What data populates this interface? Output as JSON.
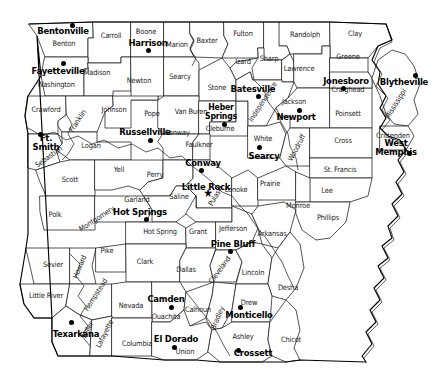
{
  "map": {
    "title": "Arkansas County Map",
    "state": "Arkansas",
    "style": {
      "background": "#ffffff",
      "county_fill": "#ffffff",
      "county_stroke": "#1a1a1a",
      "state_stroke": "#000000",
      "label_color": "#1b1b1b",
      "city_color": "#000000"
    },
    "counties": [
      {
        "name": "Benton",
        "x": 64,
        "y": 44,
        "rot": 0
      },
      {
        "name": "Carroll",
        "x": 111,
        "y": 36,
        "rot": 0
      },
      {
        "name": "Boone",
        "x": 146,
        "y": 32,
        "rot": 0
      },
      {
        "name": "Marion",
        "x": 177,
        "y": 45,
        "rot": 0
      },
      {
        "name": "Baxter",
        "x": 207,
        "y": 41,
        "rot": 0
      },
      {
        "name": "Fulton",
        "x": 243,
        "y": 34,
        "rot": 0
      },
      {
        "name": "Randolph",
        "x": 305,
        "y": 35,
        "rot": 0
      },
      {
        "name": "Clay",
        "x": 355,
        "y": 34,
        "rot": 0
      },
      {
        "name": "Washington",
        "x": 56,
        "y": 85,
        "rot": 0
      },
      {
        "name": "Madison",
        "x": 97,
        "y": 73,
        "rot": 0
      },
      {
        "name": "Newton",
        "x": 139,
        "y": 81,
        "rot": 0
      },
      {
        "name": "Searcy",
        "x": 180,
        "y": 77,
        "rot": 0
      },
      {
        "name": "Stone",
        "x": 217,
        "y": 88,
        "rot": 0
      },
      {
        "name": "Izard",
        "x": 243,
        "y": 62,
        "rot": 0
      },
      {
        "name": "Sharp",
        "x": 269,
        "y": 59,
        "rot": 0
      },
      {
        "name": "Lawrence",
        "x": 299,
        "y": 69,
        "rot": 0
      },
      {
        "name": "Greene",
        "x": 348,
        "y": 57,
        "rot": 0
      },
      {
        "name": "Craighead",
        "x": 348,
        "y": 90,
        "rot": 0
      },
      {
        "name": "Crawford",
        "x": 46,
        "y": 110,
        "rot": 0
      },
      {
        "name": "Franklin",
        "x": 78,
        "y": 121,
        "rot": -56
      },
      {
        "name": "Johnson",
        "x": 114,
        "y": 110,
        "rot": 0
      },
      {
        "name": "Pope",
        "x": 152,
        "y": 114,
        "rot": 0
      },
      {
        "name": "Van Buren",
        "x": 191,
        "y": 112,
        "rot": 0
      },
      {
        "name": "Cleburne",
        "x": 220,
        "y": 129,
        "rot": 0
      },
      {
        "name": "Independence",
        "x": 263,
        "y": 102,
        "rot": -57
      },
      {
        "name": "Jackson",
        "x": 294,
        "y": 102,
        "rot": 0
      },
      {
        "name": "Poinsett",
        "x": 348,
        "y": 114,
        "rot": 0
      },
      {
        "name": "Mississippi",
        "x": 396,
        "y": 104,
        "rot": -58
      },
      {
        "name": "Sebastian",
        "x": 49,
        "y": 157,
        "rot": -36
      },
      {
        "name": "Logan",
        "x": 91,
        "y": 146,
        "rot": 0
      },
      {
        "name": "Conway",
        "x": 177,
        "y": 133,
        "rot": 0
      },
      {
        "name": "Faulkner",
        "x": 199,
        "y": 145,
        "rot": 0
      },
      {
        "name": "White",
        "x": 263,
        "y": 139,
        "rot": 0
      },
      {
        "name": "Woodruff",
        "x": 297,
        "y": 148,
        "rot": -62
      },
      {
        "name": "Cross",
        "x": 343,
        "y": 141,
        "rot": 0
      },
      {
        "name": "Crittenden",
        "x": 393,
        "y": 136,
        "rot": 0
      },
      {
        "name": "Scott",
        "x": 70,
        "y": 180,
        "rot": 0
      },
      {
        "name": "Yell",
        "x": 119,
        "y": 170,
        "rot": 0
      },
      {
        "name": "Perry",
        "x": 155,
        "y": 175,
        "rot": 0
      },
      {
        "name": "Pulaski",
        "x": 216,
        "y": 196,
        "rot": -60
      },
      {
        "name": "Lonoke",
        "x": 236,
        "y": 190,
        "rot": 0
      },
      {
        "name": "Prairie",
        "x": 270,
        "y": 184,
        "rot": 0
      },
      {
        "name": "St. Francis",
        "x": 340,
        "y": 170,
        "rot": 0
      },
      {
        "name": "Lee",
        "x": 327,
        "y": 191,
        "rot": 0
      },
      {
        "name": "Montgomery",
        "x": 97,
        "y": 219,
        "rot": -33
      },
      {
        "name": "Garland",
        "x": 137,
        "y": 200,
        "rot": 0
      },
      {
        "name": "Saline",
        "x": 179,
        "y": 197,
        "rot": 0
      },
      {
        "name": "Monroe",
        "x": 298,
        "y": 206,
        "rot": 0
      },
      {
        "name": "Polk",
        "x": 55,
        "y": 215,
        "rot": 0
      },
      {
        "name": "Hot Spring",
        "x": 160,
        "y": 232,
        "rot": 0
      },
      {
        "name": "Grant",
        "x": 198,
        "y": 232,
        "rot": 0
      },
      {
        "name": "Jefferson",
        "x": 233,
        "y": 229,
        "rot": 0
      },
      {
        "name": "Arkansas",
        "x": 272,
        "y": 234,
        "rot": 0
      },
      {
        "name": "Phillips",
        "x": 328,
        "y": 218,
        "rot": 0
      },
      {
        "name": "Sevier",
        "x": 53,
        "y": 265,
        "rot": 0
      },
      {
        "name": "Howard",
        "x": 80,
        "y": 267,
        "rot": -68
      },
      {
        "name": "Pike",
        "x": 107,
        "y": 251,
        "rot": 0
      },
      {
        "name": "Clark",
        "x": 145,
        "y": 262,
        "rot": 0
      },
      {
        "name": "Dallas",
        "x": 186,
        "y": 270,
        "rot": 0
      },
      {
        "name": "Cleveland",
        "x": 220,
        "y": 270,
        "rot": -54
      },
      {
        "name": "Lincoln",
        "x": 253,
        "y": 273,
        "rot": 0
      },
      {
        "name": "Desha",
        "x": 288,
        "y": 288,
        "rot": 0
      },
      {
        "name": "Little River",
        "x": 46,
        "y": 296,
        "rot": 0
      },
      {
        "name": "Hempstead",
        "x": 96,
        "y": 295,
        "rot": -57
      },
      {
        "name": "Nevada",
        "x": 131,
        "y": 306,
        "rot": 0
      },
      {
        "name": "Ouachita",
        "x": 166,
        "y": 317,
        "rot": 0
      },
      {
        "name": "Calhoun",
        "x": 198,
        "y": 310,
        "rot": 0
      },
      {
        "name": "Bradley",
        "x": 218,
        "y": 318,
        "rot": -67
      },
      {
        "name": "Drew",
        "x": 249,
        "y": 303,
        "rot": 0
      },
      {
        "name": "Miller",
        "x": 88,
        "y": 330,
        "rot": -63
      },
      {
        "name": "Lafayette",
        "x": 105,
        "y": 334,
        "rot": -63
      },
      {
        "name": "Columbia",
        "x": 137,
        "y": 344,
        "rot": 0
      },
      {
        "name": "Union",
        "x": 185,
        "y": 352,
        "rot": 0
      },
      {
        "name": "Ashley",
        "x": 243,
        "y": 337,
        "rot": 0
      },
      {
        "name": "Chicot",
        "x": 291,
        "y": 340,
        "rot": 0
      }
    ],
    "cities": [
      {
        "name": "Bentonville",
        "label_x": 63,
        "label_y": 30,
        "dot_x": 72,
        "dot_y": 25,
        "marker": "dot",
        "size": "big",
        "lines": [
          "Bentonville"
        ]
      },
      {
        "name": "Harrison",
        "label_x": 148,
        "label_y": 42,
        "dot_x": 148,
        "dot_y": 50,
        "marker": "dot",
        "size": "big",
        "lines": [
          "Harrison"
        ]
      },
      {
        "name": "Fayetteville",
        "label_x": 58,
        "label_y": 70,
        "dot_x": 63,
        "dot_y": 63,
        "marker": "dot",
        "size": "big",
        "lines": [
          "Fayetteville"
        ]
      },
      {
        "name": "Batesville",
        "label_x": 253,
        "label_y": 88,
        "dot_x": 258,
        "dot_y": 96,
        "marker": "dot",
        "size": "big",
        "lines": [
          "Batesville"
        ]
      },
      {
        "name": "Jonesboro",
        "label_x": 346,
        "label_y": 80,
        "dot_x": 343,
        "dot_y": 88,
        "marker": "dot",
        "size": "big",
        "lines": [
          "Jonesboro"
        ]
      },
      {
        "name": "Blytheville",
        "label_x": 404,
        "label_y": 81,
        "dot_x": 415,
        "dot_y": 75,
        "marker": "dot",
        "size": "big",
        "lines": [
          "Blytheville"
        ]
      },
      {
        "name": "Heber Springs",
        "label_x": 221,
        "label_y": 112,
        "dot_x": 224,
        "dot_y": 124,
        "marker": "dot",
        "size": "normal",
        "lines": [
          "Heber",
          "Springs"
        ]
      },
      {
        "name": "Newport",
        "label_x": 296,
        "label_y": 116,
        "dot_x": 299,
        "dot_y": 110,
        "marker": "dot",
        "size": "big",
        "lines": [
          "Newport"
        ]
      },
      {
        "name": "Russellville",
        "label_x": 145,
        "label_y": 131,
        "dot_x": 150,
        "dot_y": 140,
        "marker": "dot",
        "size": "big",
        "lines": [
          "Russellville"
        ]
      },
      {
        "name": "Ft. Smith",
        "label_x": 46,
        "label_y": 143,
        "dot_x": 40,
        "dot_y": 134,
        "marker": "dot",
        "size": "big",
        "lines": [
          "Ft.",
          "Smith"
        ]
      },
      {
        "name": "Searcy",
        "label_x": 264,
        "label_y": 155,
        "dot_x": 259,
        "dot_y": 147,
        "marker": "dot",
        "size": "big",
        "lines": [
          "Searcy"
        ]
      },
      {
        "name": "West Memphis",
        "label_x": 396,
        "label_y": 148,
        "dot_x": 409,
        "dot_y": 153,
        "marker": "dot",
        "size": "big",
        "lines": [
          "West",
          "Memphis"
        ]
      },
      {
        "name": "Conway",
        "label_x": 203,
        "label_y": 162,
        "dot_x": 201,
        "dot_y": 170,
        "marker": "dot",
        "size": "big",
        "lines": [
          "Conway"
        ]
      },
      {
        "name": "Little Rock",
        "label_x": 206,
        "label_y": 186,
        "dot_x": 208,
        "dot_y": 193,
        "marker": "star",
        "size": "big",
        "lines": [
          "Little Rock"
        ]
      },
      {
        "name": "Hot Springs",
        "label_x": 140,
        "label_y": 211,
        "dot_x": 146,
        "dot_y": 219,
        "marker": "dot",
        "size": "big",
        "lines": [
          "Hot Springs"
        ]
      },
      {
        "name": "Pine Bluff",
        "label_x": 233,
        "label_y": 243,
        "dot_x": 230,
        "dot_y": 251,
        "marker": "dot",
        "size": "big",
        "lines": [
          "Pine Bluff"
        ]
      },
      {
        "name": "Camden",
        "label_x": 166,
        "label_y": 298,
        "dot_x": 171,
        "dot_y": 307,
        "marker": "dot",
        "size": "big",
        "lines": [
          "Camden"
        ]
      },
      {
        "name": "Texarkana",
        "label_x": 76,
        "label_y": 333,
        "dot_x": 71,
        "dot_y": 322,
        "marker": "dot",
        "size": "big",
        "lines": [
          "Texarkana"
        ]
      },
      {
        "name": "El Dorado",
        "label_x": 176,
        "label_y": 338,
        "dot_x": 174,
        "dot_y": 347,
        "marker": "dot",
        "size": "big",
        "lines": [
          "El Dorado"
        ]
      },
      {
        "name": "Monticello",
        "label_x": 249,
        "label_y": 314,
        "dot_x": 240,
        "dot_y": 307,
        "marker": "dot",
        "size": "big",
        "lines": [
          "Monticello"
        ]
      },
      {
        "name": "Crossett",
        "label_x": 253,
        "label_y": 352,
        "dot_x": 238,
        "dot_y": 350,
        "marker": "dot",
        "size": "big",
        "lines": [
          "Crossett"
        ]
      }
    ]
  }
}
